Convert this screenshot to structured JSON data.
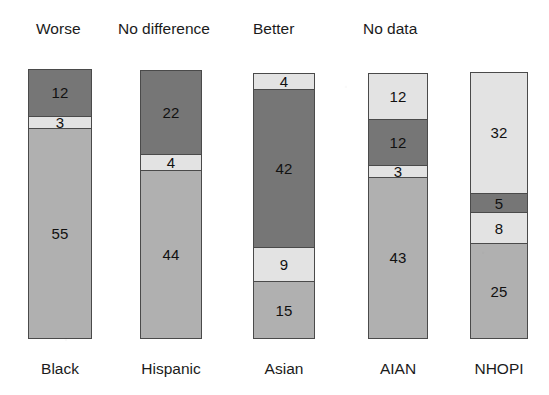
{
  "chart_data": {
    "type": "bar",
    "title": "",
    "subtitle": "",
    "xlabel": "",
    "ylabel": "",
    "stacked": true,
    "orientation": "vertical",
    "grid": false,
    "legend_position": "top",
    "legend": [
      "Worse",
      "No difference",
      "Better",
      "No data"
    ],
    "categories": [
      "Black",
      "Hispanic",
      "Asian",
      "AIAN",
      "NHOPI"
    ],
    "series": [
      {
        "name": "Worse",
        "values": [
          55,
          44,
          15,
          43,
          25
        ]
      },
      {
        "name": "No difference",
        "values": [
          12,
          22,
          42,
          12,
          5
        ]
      },
      {
        "name": "Better",
        "values": [
          3,
          4,
          9,
          3,
          8
        ]
      },
      {
        "name": "No data",
        "values": [
          0,
          0,
          4,
          12,
          32
        ]
      }
    ],
    "colors": {
      "worse": "#b0b0b0",
      "no_difference": "#767676",
      "better": "#e3e3e3",
      "no_data": "#e3e3e3",
      "outline": "#4a4a4a",
      "background": "#ffffff",
      "text": "#1b1b1b"
    },
    "bars": [
      {
        "category": "Black",
        "total": 70,
        "segments": [
          {
            "series": "No difference",
            "value": 12,
            "label": "12",
            "color": "#767676"
          },
          {
            "series": "Better",
            "value": 3,
            "label": "3",
            "color": "#e3e3e3"
          },
          {
            "series": "Worse",
            "value": 55,
            "label": "55",
            "color": "#b0b0b0"
          }
        ]
      },
      {
        "category": "Hispanic",
        "total": 70,
        "segments": [
          {
            "series": "No difference",
            "value": 22,
            "label": "22",
            "color": "#767676"
          },
          {
            "series": "Better",
            "value": 4,
            "label": "4",
            "color": "#e3e3e3"
          },
          {
            "series": "Worse",
            "value": 44,
            "label": "44",
            "color": "#b0b0b0"
          }
        ]
      },
      {
        "category": "Asian",
        "total": 70,
        "segments": [
          {
            "series": "No data",
            "value": 4,
            "label": "4",
            "color": "#e3e3e3"
          },
          {
            "series": "No difference",
            "value": 42,
            "label": "42",
            "color": "#767676"
          },
          {
            "series": "Better",
            "value": 9,
            "label": "9",
            "color": "#e3e3e3"
          },
          {
            "series": "Worse",
            "value": 15,
            "label": "15",
            "color": "#b0b0b0"
          }
        ]
      },
      {
        "category": "AIAN",
        "total": 70,
        "segments": [
          {
            "series": "No data",
            "value": 12,
            "label": "12",
            "color": "#e3e3e3"
          },
          {
            "series": "No difference",
            "value": 12,
            "label": "12",
            "color": "#767676"
          },
          {
            "series": "Better",
            "value": 3,
            "label": "3",
            "color": "#e3e3e3"
          },
          {
            "series": "Worse",
            "value": 43,
            "label": "43",
            "color": "#b0b0b0"
          }
        ]
      },
      {
        "category": "NHOPI",
        "total": 70,
        "segments": [
          {
            "series": "No data",
            "value": 32,
            "label": "32",
            "color": "#e3e3e3"
          },
          {
            "series": "No difference",
            "value": 5,
            "label": "5",
            "color": "#767676"
          },
          {
            "series": "Better",
            "value": 8,
            "label": "8",
            "color": "#e3e3e3"
          },
          {
            "series": "Worse",
            "value": 25,
            "label": "25",
            "color": "#b0b0b0"
          }
        ]
      }
    ],
    "layout": {
      "bar_left_positions": [
        28,
        140,
        253,
        368,
        470
      ],
      "bar_widths": [
        64,
        62,
        62,
        60,
        58
      ],
      "bar_bottom_y": 339,
      "bar_tops": [
        69,
        70,
        73,
        73,
        72
      ],
      "px_per_unit": 3.86
    }
  }
}
